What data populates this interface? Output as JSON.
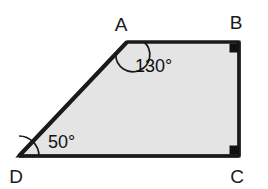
{
  "figure": {
    "shape_kind": "quadrilateral-trapezoid",
    "fill_color": "#e4e4e4",
    "stroke_color": "#1a1a1a",
    "background_color": "#ffffff",
    "label_color": "#1a1a1a"
  },
  "vertices": [
    {
      "id": "A",
      "label": "A",
      "x": 127,
      "y": 42,
      "label_x": 121,
      "label_y": 31
    },
    {
      "id": "B",
      "label": "B",
      "x": 239,
      "y": 42,
      "label_x": 233,
      "label_y": 29
    },
    {
      "id": "C",
      "label": "C",
      "x": 239,
      "y": 156,
      "label_x": 233,
      "label_y": 183
    },
    {
      "id": "D",
      "label": "D",
      "x": 19,
      "y": 156,
      "label_x": 11,
      "label_y": 183
    }
  ],
  "edges": [
    {
      "id": "AB",
      "from": "A",
      "to": "B"
    },
    {
      "id": "BC",
      "from": "B",
      "to": "C"
    },
    {
      "id": "CD",
      "from": "C",
      "to": "D"
    },
    {
      "id": "DA",
      "from": "D",
      "to": "A"
    }
  ],
  "angles": [
    {
      "id": "angle-A",
      "vertex": "A",
      "value": 130,
      "label": "130°",
      "marker": "arc",
      "label_x": 135,
      "label_y": 72
    },
    {
      "id": "angle-D",
      "vertex": "D",
      "value": 50,
      "label": "50°",
      "marker": "arc",
      "label_x": 48,
      "label_y": 148
    },
    {
      "id": "angle-B",
      "vertex": "B",
      "value": 90,
      "label": "",
      "marker": "right-angle-square"
    },
    {
      "id": "angle-C",
      "vertex": "C",
      "value": 90,
      "label": "",
      "marker": "right-angle-square"
    }
  ],
  "polygon_points": "127,42 239,42 239,156 19,156"
}
